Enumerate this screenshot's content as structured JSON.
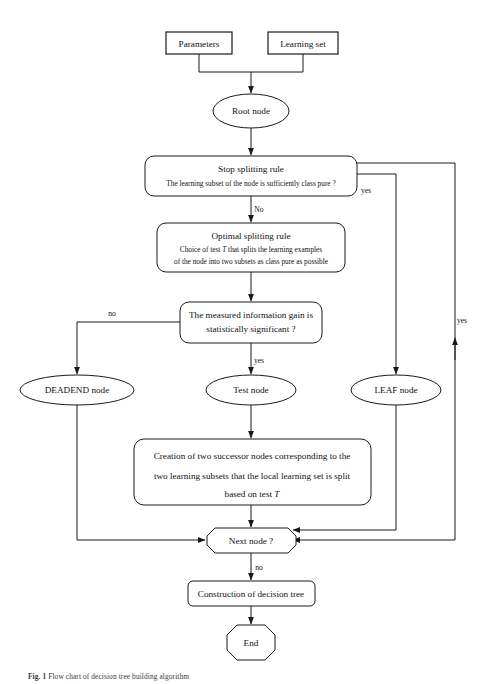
{
  "figure": {
    "caption_prefix": "Fig. 1",
    "caption_text": "Flow chart of decision tree building algorithm",
    "background": "#ffffff",
    "line_color": "#1a1a1a"
  },
  "nodes": {
    "parameters": {
      "label": "Parameters",
      "shape": "rectangle"
    },
    "learning_set": {
      "label": "Learning set",
      "shape": "rectangle"
    },
    "root_node": {
      "label": "Root node",
      "shape": "ellipse"
    },
    "stop_rule": {
      "title": "Stop splitting rule",
      "detail": "The learning subset of the node is sufficiently class pure ?",
      "shape": "rounded-rectangle"
    },
    "optimal_rule": {
      "title": "Optimal splitting rule",
      "detail_line1_a": "Choice of test ",
      "detail_line1_italic": "T",
      "detail_line1_b": " that splits the learning examples",
      "detail_line2": "of the node into two subsets as class pure as possible",
      "shape": "rounded-rectangle"
    },
    "info_gain": {
      "line1": "The measured information gain is",
      "line2": "statistically significant ?",
      "shape": "rounded-rectangle"
    },
    "deadend_node": {
      "label": "DEADEND node",
      "shape": "ellipse"
    },
    "test_node": {
      "label": "Test node",
      "shape": "ellipse"
    },
    "leaf_node": {
      "label": "LEAF node",
      "shape": "ellipse"
    },
    "creation": {
      "line1": "Creation of two successor nodes corresponding to the",
      "line2": "two learning subsets that the local learning set is split",
      "line3_a": "based on test ",
      "line3_italic": "T",
      "shape": "rounded-rectangle"
    },
    "next_node": {
      "label": "Next node ?",
      "shape": "octagon"
    },
    "construction": {
      "label": "Construction of decision tree",
      "shape": "rounded-rectangle"
    },
    "end_node": {
      "label": "End",
      "shape": "octagon"
    }
  },
  "edge_labels": {
    "stop_no": "No",
    "stop_yes_leaf": "yes",
    "stop_yes_loop": "yes",
    "gain_no": "no",
    "gain_yes": "yes",
    "next_no": "no"
  }
}
